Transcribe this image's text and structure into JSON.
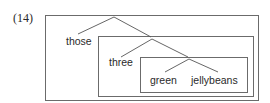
{
  "example_number": "(14)",
  "tree": {
    "root": {
      "left_leaf": "those",
      "right": {
        "left_leaf": "three",
        "right": {
          "left_leaf": "green",
          "right_leaf": "jellybeans"
        }
      }
    }
  },
  "words": [
    "those",
    "three",
    "green",
    "jellybeans"
  ],
  "boxes": [
    {
      "name": "outer",
      "contains": [
        "those",
        "three",
        "green",
        "jellybeans"
      ]
    },
    {
      "name": "middle",
      "contains": [
        "three",
        "green",
        "jellybeans"
      ]
    },
    {
      "name": "inner",
      "contains": [
        "green",
        "jellybeans"
      ]
    }
  ],
  "colors": {
    "line": "#555555",
    "box": "#6b6b6b",
    "text": "#2a2a2a"
  }
}
